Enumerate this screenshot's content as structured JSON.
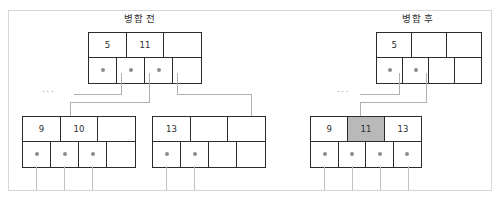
{
  "figure": {
    "title_before": "병합 전",
    "title_after": "병합 후",
    "ellipsis_left": "...",
    "ellipsis_right": "..."
  },
  "before": {
    "parent": {
      "keys": [
        "5",
        "11",
        ""
      ],
      "pointers": [
        "dot",
        "dot",
        "dot",
        ""
      ]
    },
    "child_left": {
      "keys": [
        "9",
        "10",
        ""
      ],
      "pointers": [
        "dot",
        "dot",
        "dot",
        ""
      ]
    },
    "child_right": {
      "keys": [
        "13",
        "",
        ""
      ],
      "pointers": [
        "dot",
        "dot",
        "",
        ""
      ]
    }
  },
  "after": {
    "parent": {
      "keys": [
        "5",
        "",
        ""
      ],
      "pointers": [
        "dot",
        "dot",
        "",
        ""
      ]
    },
    "merged_child": {
      "keys": [
        "9",
        "11",
        "13"
      ],
      "highlight_index": 1,
      "pointers": [
        "dot",
        "dot",
        "dot",
        "dot"
      ]
    }
  },
  "colors": {
    "border": "#2b2b2b",
    "highlight": "#b9b9b9",
    "connector": "#b0b0b0",
    "frame": "#d6d6d6",
    "text": "#2b2b2b"
  }
}
